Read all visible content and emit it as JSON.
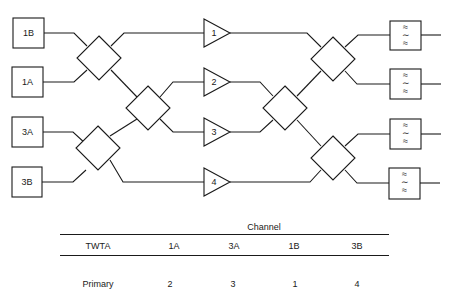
{
  "diagram": {
    "inputs": [
      {
        "label": "1B",
        "x": 13,
        "y": 18,
        "w": 31,
        "h": 30
      },
      {
        "label": "1A",
        "x": 12,
        "y": 67,
        "w": 31,
        "h": 30
      },
      {
        "label": "3A",
        "x": 12,
        "y": 117,
        "w": 31,
        "h": 30
      },
      {
        "label": "3B",
        "x": 12,
        "y": 167,
        "w": 30,
        "h": 30
      }
    ],
    "amplifiers": [
      {
        "label": "1",
        "x": 204,
        "cy": 33
      },
      {
        "label": "2",
        "x": 204,
        "cy": 82
      },
      {
        "label": "3",
        "x": 204,
        "cy": 132
      },
      {
        "label": "4",
        "x": 204,
        "cy": 182
      }
    ],
    "filters": [
      {
        "symbol": "≈\n∼\n≈",
        "x": 390,
        "y": 21
      },
      {
        "symbol": "≈\n∼\n≈",
        "x": 390,
        "y": 69
      },
      {
        "symbol": "≈\n∼\n≈",
        "x": 390,
        "y": 119
      },
      {
        "symbol": "≈\n∼\n≈",
        "x": 390,
        "y": 168
      }
    ],
    "hybrids": [
      {
        "name": "input-hybrid-top",
        "cx": 99,
        "cy": 58
      },
      {
        "name": "input-hybrid-bottom",
        "cx": 98,
        "cy": 148
      },
      {
        "name": "input-hybrid-middle",
        "cx": 148,
        "cy": 108
      },
      {
        "name": "output-hybrid-middle",
        "cx": 285,
        "cy": 108
      },
      {
        "name": "output-hybrid-top",
        "cx": 333,
        "cy": 59
      },
      {
        "name": "output-hybrid-bottom",
        "cx": 333,
        "cy": 158
      }
    ]
  },
  "table": {
    "group_header": "Channel",
    "row_header_label": "TWTA",
    "columns": [
      "1A",
      "3A",
      "1B",
      "3B"
    ],
    "rows": [
      {
        "label": "Primary",
        "values": [
          "2",
          "3",
          "1",
          "4"
        ]
      }
    ]
  }
}
